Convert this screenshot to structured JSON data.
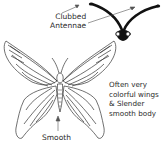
{
  "diagram": {
    "labels": {
      "antennae": [
        "Clubbed",
        "Antennae"
      ],
      "description": [
        "Often very",
        "colorful wings",
        "& Slender",
        "smooth body"
      ],
      "body": "Smooth"
    },
    "colors": {
      "line": "#2a2a2a",
      "head": "#111111",
      "background": "#ffffff"
    }
  }
}
